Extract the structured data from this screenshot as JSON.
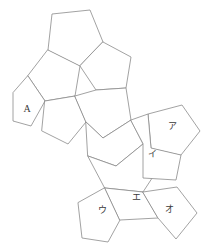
{
  "figure": {
    "kind": "dodecahedron-net",
    "title": "",
    "background_color": "#ffffff",
    "stroke_color": "#8a8a8a",
    "stroke_width": 0.8,
    "fill_color": "#ffffff",
    "label_color": "#3a3a3a",
    "width": 208,
    "height": 249
  },
  "faces": [
    {
      "id": "face-top",
      "label": "",
      "points": "48,50 52,14 90,10 103,42 80,66",
      "label_x": 75,
      "label_y": 36
    },
    {
      "id": "face-upper-right",
      "label": "",
      "points": "103,42 131,57 126,88 96,90 80,66",
      "label_x": 108,
      "label_y": 68
    },
    {
      "id": "face-upper-left",
      "label": "",
      "points": "48,50 80,66 75,96 45,101 28,76",
      "label_x": 55,
      "label_y": 78
    },
    {
      "id": "face-a",
      "label": "A",
      "points": "28,76 45,101 31,126 13,121 13,93",
      "label_x": 27,
      "label_y": 108
    },
    {
      "id": "face-a-lower",
      "label": "",
      "points": "45,101 75,96 86,122 68,144 42,131",
      "label_x": 63,
      "label_y": 121
    },
    {
      "id": "face-center-upper",
      "label": "",
      "points": "75,96 96,90 126,88 131,120 103,138 86,122",
      "label_x": 106,
      "label_y": 112
    },
    {
      "id": "face-center-lower",
      "label": "",
      "points": "86,122 103,138 131,120 143,144 116,166 88,156",
      "label_x": 115,
      "label_y": 145
    },
    {
      "id": "face-center-bottom",
      "label": "",
      "points": "88,156 116,166 143,144 160,166 143,192 105,188",
      "label_x": 125,
      "label_y": 172
    },
    {
      "id": "face-a-ri",
      "label": "ア",
      "points": "151,148 148,114 182,105 200,131 181,155",
      "label_x": 172,
      "label_y": 126
    },
    {
      "id": "face-i",
      "label": "イ",
      "points": "131,120 148,114 151,148 181,155 176,180 143,178 143,144",
      "label_x": 152,
      "label_y": 154
    },
    {
      "id": "face-u",
      "label": "ウ",
      "points": "105,188 120,220 108,242 82,238 78,203",
      "label_x": 102,
      "label_y": 210
    },
    {
      "id": "face-e",
      "label": "エ",
      "points": "105,188 143,192 158,218 120,220",
      "label_x": 136,
      "label_y": 197
    },
    {
      "id": "face-o",
      "label": "オ",
      "points": "143,192 177,187 197,213 176,239 158,218",
      "label_x": 169,
      "label_y": 209
    }
  ]
}
